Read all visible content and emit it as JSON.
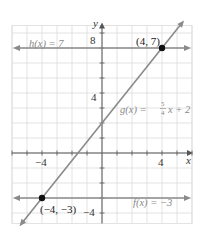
{
  "chart_data": {
    "type": "line",
    "title": "",
    "xlabel": "x",
    "ylabel": "y",
    "xlim": [
      -6,
      6
    ],
    "ylim": [
      -4.7,
      8.5
    ],
    "grid": true,
    "x_ticks": [
      -4,
      4
    ],
    "y_ticks": [
      -4,
      4,
      8
    ],
    "x_tick_labels": [
      "−4",
      "4"
    ],
    "y_tick_labels": [
      "−4",
      "4",
      "8"
    ],
    "series": [
      {
        "name": "h(x) = 7",
        "kind": "horizontal",
        "equation": "h(x) = 7",
        "y": 7,
        "x_range": [
          -6,
          6
        ]
      },
      {
        "name": "f(x) = −3",
        "kind": "horizontal",
        "equation": "f(x) = −3",
        "y": -3,
        "x_range": [
          -6,
          6
        ]
      },
      {
        "name": "g(x) = 5/4 x + 2",
        "kind": "linear",
        "slope": 1.25,
        "intercept": 2,
        "x_range": [
          -5.5,
          5.47
        ]
      }
    ],
    "points": [
      {
        "x": 4,
        "y": 7,
        "label": "(4, 7)"
      },
      {
        "x": -4,
        "y": -3,
        "label": "(−4, −3)"
      }
    ],
    "annotations": {
      "h_label": "h(x) = 7",
      "f_label": "f(x) = −3",
      "g_label_prefix": "g(x) = ",
      "g_frac_num": "5",
      "g_frac_den": "4",
      "g_label_suffix": "x + 2"
    },
    "colors": {
      "grid": "#dcdcdc",
      "axis": "#555555",
      "line": "#8a8a8a",
      "function_label": "#8a8a8a",
      "point": "#111111",
      "point_label": "#222222"
    }
  }
}
